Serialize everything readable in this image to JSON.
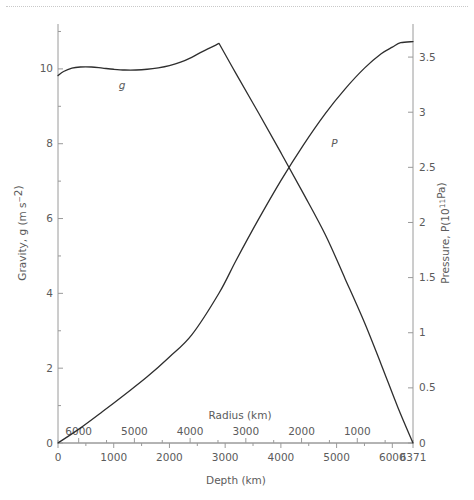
{
  "figure": {
    "background_color": "#ffffff",
    "line_color": "#2e2e2e",
    "axis_color": "#9a9a9a",
    "text_color": "#5b5b5b"
  },
  "chart_data": {
    "type": "line",
    "title": "",
    "xlabel": "Depth (km)",
    "ylabel": "Gravity, g (m s−2)",
    "y2label": "Pressure, P(10¹¹Pa)",
    "secondary_xlabel": "Radius (km)",
    "xlim": [
      0,
      6371
    ],
    "ylim": [
      0,
      11.2
    ],
    "y2lim": [
      0,
      3.8
    ],
    "grid": false,
    "legend_position": "inline-annotation",
    "x_ticks_major": [
      0,
      1000,
      2000,
      3000,
      4000,
      5000,
      6000,
      6371
    ],
    "x_tick_labels": [
      "0",
      "1000",
      "2000",
      "3000",
      "4000",
      "5000",
      "6000",
      "6371"
    ],
    "x_ticks_minor": [
      500,
      1500,
      2500,
      3500,
      4500,
      5500
    ],
    "radius_ticks_major": [
      6000,
      5000,
      4000,
      3000,
      2000,
      1000
    ],
    "radius_tick_labels": [
      "6000",
      "5000",
      "4000",
      "3000",
      "2000",
      "1000"
    ],
    "radius_ticks_minor": [
      6371,
      5500,
      4500,
      3500,
      2500,
      1500,
      500,
      0
    ],
    "y_ticks_major": [
      0,
      2,
      4,
      6,
      8,
      10
    ],
    "y_tick_labels": [
      "0",
      "2",
      "4",
      "6",
      "8",
      "10"
    ],
    "y_ticks_minor": [
      1,
      3,
      5,
      7,
      9,
      11
    ],
    "y2_ticks_major": [
      0,
      0.5,
      1,
      1.5,
      2,
      2.5,
      3,
      3.5
    ],
    "y2_tick_labels": [
      "0",
      "0.5",
      "1",
      "1.5",
      "2",
      "2.5",
      "3",
      "3.5"
    ],
    "annotations": [
      {
        "text": "g",
        "depth_km": 1150,
        "value": 9.55,
        "axis": "left"
      },
      {
        "text": "P",
        "depth_km": 4960,
        "value": 2.72,
        "axis": "right"
      }
    ],
    "series": [
      {
        "name": "g",
        "label": "Gravity, g (m s−2)",
        "axis": "left",
        "units": "m s^-2",
        "x": [
          0,
          100,
          250,
          400,
          600,
          800,
          1000,
          1200,
          1400,
          1600,
          1800,
          2000,
          2200,
          2400,
          2600,
          2891,
          2891,
          3200,
          3600,
          4000,
          4400,
          4800,
          5150,
          5500,
          5800,
          6100,
          6371
        ],
        "values": [
          9.82,
          9.93,
          10.02,
          10.05,
          10.05,
          10.02,
          9.99,
          9.97,
          9.97,
          9.99,
          10.03,
          10.09,
          10.18,
          10.31,
          10.47,
          10.68,
          10.68,
          9.86,
          8.82,
          7.76,
          6.68,
          5.56,
          4.4,
          3.22,
          2.1,
          0.95,
          0.0
        ]
      },
      {
        "name": "P",
        "label": "Pressure, P(10¹¹Pa)",
        "axis": "right",
        "units": "10^11 Pa",
        "x": [
          0,
          400,
          800,
          1200,
          1600,
          2000,
          2400,
          2891,
          3200,
          3600,
          4000,
          4400,
          4800,
          5150,
          5500,
          5800,
          6000,
          6150,
          6371
        ],
        "values": [
          0.0,
          0.135,
          0.285,
          0.44,
          0.6,
          0.78,
          0.98,
          1.36,
          1.66,
          2.03,
          2.38,
          2.7,
          2.99,
          3.21,
          3.4,
          3.53,
          3.59,
          3.63,
          3.64
        ]
      }
    ],
    "notable_points": {
      "core_mantle_boundary_depth_km": 2891,
      "gravity_peak": 10.68,
      "pressure_at_cmb": 1.36,
      "pressure_at_center": 3.64,
      "gravity_at_surface": 9.82,
      "crossover_depth_km": 4050,
      "crossover_gravity": 7.62,
      "crossover_pressure": 2.53
    }
  }
}
